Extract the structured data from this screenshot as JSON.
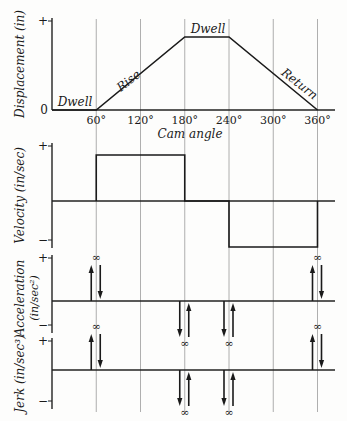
{
  "chart_data": [
    {
      "id": "displacement",
      "type": "line",
      "ylabel": "Displacement (in)",
      "xlabel": "Cam angle",
      "x_unit": "degrees",
      "xlim": [
        0,
        360
      ],
      "x_ticks": [
        60,
        120,
        180,
        240,
        300,
        360
      ],
      "x_tick_labels": [
        "60°",
        "120°",
        "180°",
        "240°",
        "300°",
        "360°"
      ],
      "y_ticks": [
        "0",
        "+"
      ],
      "ylim": [
        0,
        1.15
      ],
      "grid": "vertical",
      "series": [
        {
          "name": "displacement",
          "x": [
            0,
            60,
            180,
            240,
            360
          ],
          "y": [
            0,
            0,
            1,
            1,
            0
          ]
        }
      ],
      "annotations": [
        {
          "text": "Dwell",
          "x": 30,
          "y": 0
        },
        {
          "text": "Rise",
          "x": 120,
          "y": 0.5
        },
        {
          "text": "Dwell",
          "x": 210,
          "y": 1
        },
        {
          "text": "Return",
          "x": 300,
          "y": 0.5
        }
      ]
    },
    {
      "id": "velocity",
      "type": "line",
      "ylabel": "Velocity (in/sec)",
      "xlim": [
        0,
        360
      ],
      "y_ticks": [
        "+",
        "−"
      ],
      "ylim": [
        -1.2,
        1.2
      ],
      "grid": "vertical",
      "series": [
        {
          "name": "velocity",
          "x": [
            60,
            60,
            180,
            180,
            240,
            240,
            360,
            360
          ],
          "y": [
            0,
            1,
            1,
            0,
            0,
            -1,
            -1,
            0
          ]
        }
      ]
    },
    {
      "id": "acceleration",
      "type": "impulse",
      "ylabel": "Acceleration",
      "ylabel2": "(in/sec²)",
      "xlim": [
        0,
        360
      ],
      "y_ticks": [
        "+",
        "−"
      ],
      "ylim": [
        -1.2,
        1.2
      ],
      "grid": "vertical",
      "impulses": [
        {
          "x": 60,
          "label": "∞",
          "side": "positive",
          "arrows": [
            "up",
            "down"
          ]
        },
        {
          "x": 180,
          "label": "∞",
          "side": "negative",
          "arrows": [
            "down",
            "up"
          ]
        },
        {
          "x": 240,
          "label": "∞",
          "side": "negative",
          "arrows": [
            "down",
            "up"
          ]
        },
        {
          "x": 360,
          "label": "∞",
          "side": "positive",
          "arrows": [
            "up",
            "down"
          ]
        }
      ]
    },
    {
      "id": "jerk",
      "type": "impulse",
      "ylabel": "Jerk (in/sec³)",
      "xlim": [
        0,
        360
      ],
      "y_ticks": [
        "+",
        "−"
      ],
      "ylim": [
        -1.2,
        1.2
      ],
      "grid": "vertical",
      "impulses": [
        {
          "x": 60,
          "label": "∞",
          "side": "positive",
          "arrows": [
            "up",
            "down"
          ]
        },
        {
          "x": 180,
          "label": "∞",
          "side": "negative",
          "arrows": [
            "down",
            "up"
          ]
        },
        {
          "x": 240,
          "label": "∞",
          "side": "negative",
          "arrows": [
            "down",
            "up"
          ]
        },
        {
          "x": 360,
          "label": "∞",
          "side": "positive",
          "arrows": [
            "up",
            "down"
          ]
        }
      ]
    }
  ]
}
